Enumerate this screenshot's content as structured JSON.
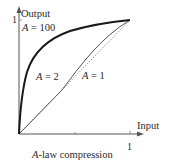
{
  "diagram": {
    "caption_var": "A",
    "caption_rest": "-law compression",
    "x_axis": {
      "label": "Input",
      "tick_label": "1",
      "ticks": [
        0.5,
        1
      ]
    },
    "y_axis": {
      "label": "Output",
      "tick_label": "1"
    },
    "curves": [
      {
        "name": "A = 100",
        "var": "A",
        "eq": " = 100",
        "style": "thick"
      },
      {
        "name": "A = 2",
        "var": "A",
        "eq": " = 2",
        "style": "thin"
      },
      {
        "name": "A = 1",
        "var": "A",
        "eq": " = 1",
        "style": "dotted"
      }
    ]
  }
}
